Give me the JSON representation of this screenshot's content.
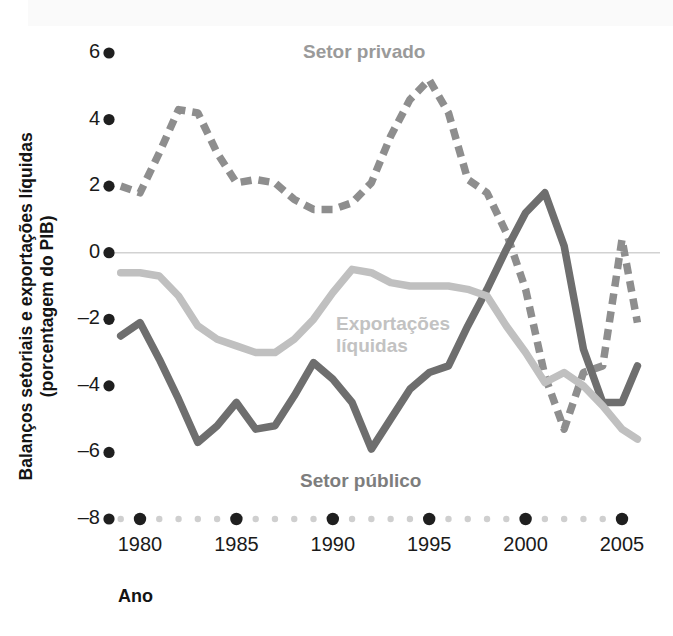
{
  "figure": {
    "background": "#ffffff"
  },
  "axes": {
    "ylabel_line1": "Balanços setoriais e exportações líquidas",
    "ylabel_line2": "(porcentagem do PIB)",
    "xlabel": "Ano",
    "yticks": [
      "6",
      "4",
      "2",
      "0",
      "-2",
      "-4",
      "-6",
      "-8"
    ],
    "ytick_values": [
      6,
      4,
      2,
      0,
      -2,
      -4,
      -6,
      -8
    ],
    "xticks": [
      "1980",
      "1985",
      "1990",
      "1995",
      "2000",
      "2005"
    ],
    "xtick_values": [
      1980,
      1985,
      1990,
      1995,
      2000,
      2005
    ]
  },
  "annotations": {
    "privado": "Setor privado",
    "publico": "Setor público",
    "exportacoes": "Exportações líquidas"
  },
  "colors": {
    "setor_privado": "#8e8e8e",
    "setor_publico": "#6e6e6e",
    "exportacoes_liquidas": "#c0c0c0",
    "zero_line": "#d2d2d2",
    "tick_major": "#1f1f1f",
    "tick_minor": "#cfcfcf",
    "text": "#141414"
  },
  "chart_data": {
    "type": "line",
    "title": "",
    "xlabel": "Ano",
    "ylabel": "Balanços setoriais e exportações líquidas (porcentagem do PIB)",
    "xlim": [
      1979,
      2005.8
    ],
    "ylim": [
      -8,
      6
    ],
    "grid": false,
    "zero_line": 0,
    "legend_position": "in-plot annotations",
    "x": [
      1979,
      1980,
      1981,
      1982,
      1983,
      1984,
      1985,
      1986,
      1987,
      1988,
      1989,
      1990,
      1991,
      1992,
      1993,
      1994,
      1995,
      1996,
      1997,
      1998,
      1999,
      2000,
      2001,
      2002,
      2003,
      2004,
      2005,
      2005.8
    ],
    "series": [
      {
        "name": "Setor privado",
        "style": "dashed",
        "color": "#8e8e8e",
        "values": [
          2.0,
          1.8,
          3.0,
          4.3,
          4.2,
          3.0,
          2.1,
          2.2,
          2.1,
          1.6,
          1.3,
          1.3,
          1.5,
          2.1,
          3.5,
          4.6,
          5.2,
          4.2,
          2.2,
          1.8,
          0.6,
          -1.1,
          -3.7,
          -5.3,
          -3.6,
          -3.4,
          0.4,
          -2.1
        ]
      },
      {
        "name": "Setor público",
        "style": "solid",
        "color": "#6e6e6e",
        "values": [
          -2.5,
          -2.1,
          -3.2,
          -4.4,
          -5.7,
          -5.2,
          -4.5,
          -5.3,
          -5.2,
          -4.3,
          -3.3,
          -3.8,
          -4.5,
          -5.9,
          -5.0,
          -4.1,
          -3.6,
          -3.4,
          -2.2,
          -1.1,
          0.1,
          1.2,
          1.8,
          0.2,
          -2.9,
          -4.5,
          -4.5,
          -3.4
        ]
      },
      {
        "name": "Exportações líquidas",
        "style": "solid",
        "color": "#c0c0c0",
        "values": [
          -0.6,
          -0.6,
          -0.7,
          -1.3,
          -2.2,
          -2.6,
          -2.8,
          -3.0,
          -3.0,
          -2.6,
          -2.0,
          -1.2,
          -0.5,
          -0.6,
          -0.9,
          -1.0,
          -1.0,
          -1.0,
          -1.1,
          -1.3,
          -2.2,
          -3.0,
          -3.9,
          -3.6,
          -4.0,
          -4.6,
          -5.3,
          -5.6
        ]
      }
    ]
  }
}
